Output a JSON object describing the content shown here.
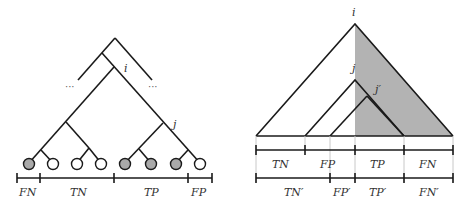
{
  "left_tree": {
    "node_labels": {
      "i": "i",
      "j": "j"
    },
    "ellipsis_left": "···",
    "ellipsis_right": "···",
    "leaves": [
      {
        "x": 29,
        "filled": true
      },
      {
        "x": 53,
        "filled": false
      },
      {
        "x": 77,
        "filled": false
      },
      {
        "x": 101,
        "filled": false
      },
      {
        "x": 125,
        "filled": true
      },
      {
        "x": 151,
        "filled": true
      },
      {
        "x": 176,
        "filled": true
      },
      {
        "x": 200,
        "filled": false
      }
    ],
    "segments": [
      "FN",
      "TN",
      "TP",
      "FP"
    ]
  },
  "right_tree": {
    "node_labels": {
      "i": "i",
      "j": "j",
      "j_prime": "j′"
    },
    "row1_segments": [
      "TN",
      "FP",
      "TP",
      "FN"
    ],
    "row2_segments": [
      "TN′",
      "FP′",
      "TP′",
      "FN′"
    ]
  },
  "colors": {
    "line": "#1a1a1a",
    "leaf_fill": "#a9a9a9",
    "shade": "#b3b3b3",
    "guide": "#c8c8c8"
  }
}
